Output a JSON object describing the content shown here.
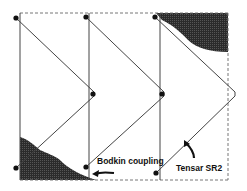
{
  "diagram": {
    "labels": {
      "coupling": "Bodkin coupling",
      "grid": "Tensar SR2"
    },
    "colors": {
      "line": "#444444",
      "dashed_border": "#777777",
      "shaded_region": "#2b2b2b",
      "node": "#111111",
      "background": "#ffffff"
    },
    "elements": {
      "vertical_bars": 3,
      "nodes": 8,
      "shaded_regions": [
        "top-right",
        "bottom-left"
      ],
      "arrows": [
        "bodkin-coupling-arrow",
        "tensar-sr2-arrow"
      ]
    }
  }
}
